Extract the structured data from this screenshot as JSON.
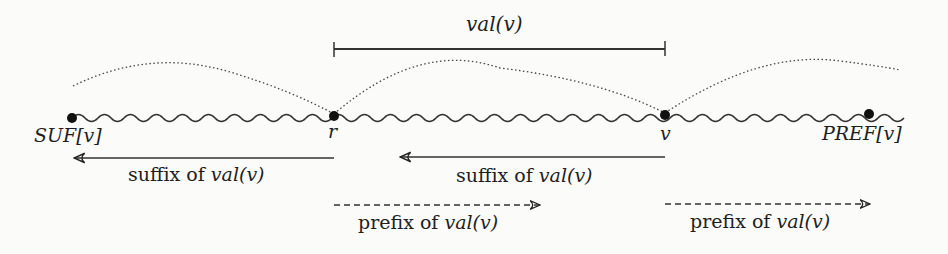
{
  "diagram": {
    "interval_label": "val(v)",
    "nodes": [
      {
        "id": "suf",
        "label": "SUF[v]",
        "x": 72
      },
      {
        "id": "r",
        "label": "r",
        "x": 334
      },
      {
        "id": "v",
        "label": "v",
        "x": 665
      },
      {
        "id": "pref",
        "label": "PREF[v]",
        "x": 869
      }
    ],
    "arrows": [
      {
        "id": "suffix-arrow-1",
        "label_plain": "suffix of ",
        "label_math": "val(v)",
        "direction": "left",
        "style": "solid"
      },
      {
        "id": "suffix-arrow-2",
        "label_plain": "suffix of ",
        "label_math": "val(v)",
        "direction": "left",
        "style": "solid"
      },
      {
        "id": "prefix-arrow-1",
        "label_plain": "prefix of ",
        "label_math": "val(v)",
        "direction": "right",
        "style": "dashed"
      },
      {
        "id": "prefix-arrow-2",
        "label_plain": "prefix of ",
        "label_math": "val(v)",
        "direction": "right",
        "style": "dashed"
      }
    ]
  }
}
